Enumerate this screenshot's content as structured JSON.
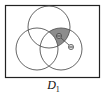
{
  "diagram": {
    "type": "venn",
    "caption": "D",
    "caption_subscript": "1",
    "universe_rect": {
      "x": 5,
      "y": 5,
      "w": 95,
      "h": 73
    },
    "circles": [
      {
        "name": "top",
        "cx": 49,
        "cy": 27,
        "r": 21
      },
      {
        "name": "left",
        "cx": 37,
        "cy": 49,
        "r": 21
      },
      {
        "name": "right",
        "cx": 61,
        "cy": 49,
        "r": 21
      }
    ],
    "shaded_region": "top ∩ right minus left",
    "markers": [
      {
        "cx": 59,
        "cy": 36,
        "label": "ω"
      },
      {
        "cx": 71,
        "cy": 47,
        "label": "ω"
      }
    ],
    "colors": {
      "stroke": "#555555",
      "shade": "#8c8c8c",
      "frame": "#222222"
    }
  }
}
